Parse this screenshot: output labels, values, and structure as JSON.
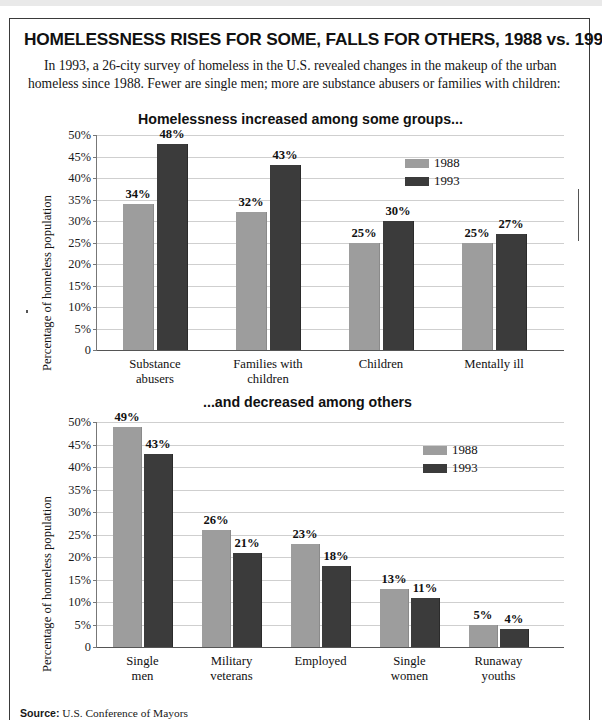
{
  "headline": "HOMELESSNESS RISES FOR SOME, FALLS FOR OTHERS, 1988 vs. 1993",
  "deck": "In 1993, a 26-city survey of homeless in the U.S. revealed changes in the makeup of the urban homeless since 1988. Fewer are single men; more are substance abusers or families with children:",
  "source_label": "Source:",
  "source_text": "U.S. Conference of Mayors",
  "colors": {
    "series_1988": "#9d9d9d",
    "series_1993": "#3b3b3b",
    "gridline": "#cfcfcf",
    "frame": "#3a3a3a"
  },
  "chart_data": [
    {
      "type": "bar",
      "title": "Homelessness increased among some groups...",
      "xlabel": "",
      "ylabel": "Percentage of homeless population",
      "ylim": [
        0,
        50
      ],
      "ytick_labels": [
        "50%",
        "45%",
        "40%",
        "35%",
        "30%",
        "25%",
        "20%",
        "15%",
        "10%",
        "5%",
        "0"
      ],
      "ytick_values": [
        50,
        45,
        40,
        35,
        30,
        25,
        20,
        15,
        10,
        5,
        0
      ],
      "grid": true,
      "legend_position": "top-right",
      "categories": [
        "Substance abusers",
        "Families with children",
        "Children",
        "Mentally ill"
      ],
      "category_lines": [
        [
          "Substance",
          "abusers"
        ],
        [
          "Families with",
          "children"
        ],
        [
          "Children"
        ],
        [
          "Mentally ill"
        ]
      ],
      "series": [
        {
          "name": "1988",
          "values": [
            34,
            32,
            25,
            25
          ],
          "labels": [
            "34%",
            "32%",
            "25%",
            "25%"
          ]
        },
        {
          "name": "1993",
          "values": [
            48,
            43,
            30,
            27
          ],
          "labels": [
            "48%",
            "43%",
            "30%",
            "27%"
          ]
        }
      ]
    },
    {
      "type": "bar",
      "title": "...and decreased among others",
      "xlabel": "",
      "ylabel": "Percentage of homeless population",
      "ylim": [
        0,
        50
      ],
      "ytick_labels": [
        "50%",
        "45%",
        "40%",
        "35%",
        "30%",
        "25%",
        "20%",
        "15%",
        "10%",
        "5%",
        "0"
      ],
      "ytick_values": [
        50,
        45,
        40,
        35,
        30,
        25,
        20,
        15,
        10,
        5,
        0
      ],
      "grid": true,
      "legend_position": "top-right",
      "categories": [
        "Single men",
        "Military veterans",
        "Employed",
        "Single women",
        "Runaway youths"
      ],
      "category_lines": [
        [
          "Single",
          "men"
        ],
        [
          "Military",
          "veterans"
        ],
        [
          "Employed"
        ],
        [
          "Single",
          "women"
        ],
        [
          "Runaway",
          "youths"
        ]
      ],
      "series": [
        {
          "name": "1988",
          "values": [
            49,
            26,
            23,
            13,
            5
          ],
          "labels": [
            "49%",
            "26%",
            "23%",
            "13%",
            "5%"
          ]
        },
        {
          "name": "1993",
          "values": [
            43,
            21,
            18,
            11,
            4
          ],
          "labels": [
            "43%",
            "21%",
            "18%",
            "11%",
            "4%"
          ]
        }
      ]
    }
  ]
}
